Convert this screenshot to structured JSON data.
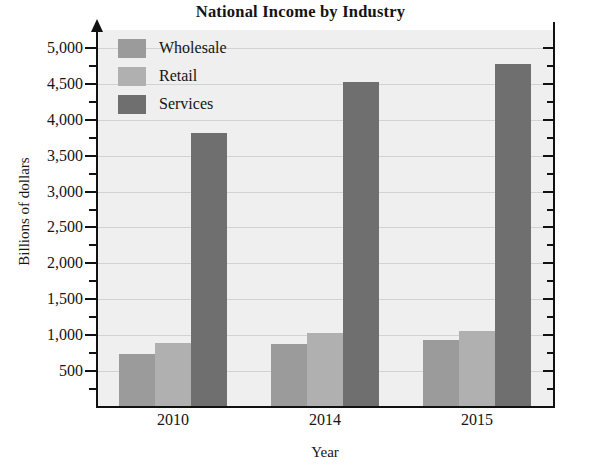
{
  "chart_data": {
    "type": "bar",
    "title": "National Income by Industry",
    "xlabel": "Year",
    "ylabel": "Billions of dollars",
    "categories": [
      "2010",
      "2014",
      "2015"
    ],
    "series": [
      {
        "name": "Wholesale",
        "color": "#9b9b9b",
        "values": [
          740,
          880,
          930
        ]
      },
      {
        "name": "Retail",
        "color": "#b0b0b0",
        "values": [
          890,
          1030,
          1060
        ]
      },
      {
        "name": "Services",
        "color": "#6f6f6f",
        "values": [
          3820,
          4520,
          4780
        ]
      }
    ],
    "ylim": [
      0,
      5250
    ],
    "ytick_labels": [
      "500",
      "1,000",
      "1,500",
      "2,000",
      "2,500",
      "3,000",
      "3,500",
      "4,000",
      "4,500",
      "5,000"
    ],
    "ytick_values": [
      500,
      1000,
      1500,
      2000,
      2500,
      3000,
      3500,
      4000,
      4500,
      5000
    ],
    "minor_tick_step": 250,
    "grid": true,
    "legend_position": "top-left",
    "plot_background": "#efefef",
    "axis_color": "#111111",
    "gridline_color": "#d2d2d2"
  }
}
